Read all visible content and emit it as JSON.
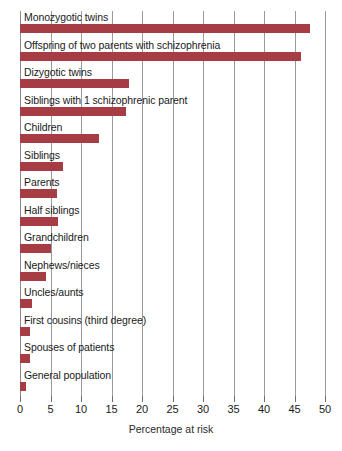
{
  "chart_data": {
    "type": "bar",
    "orientation": "horizontal",
    "title": "",
    "xlabel": "Percentage at risk",
    "ylabel": "",
    "xlim": [
      0,
      50
    ],
    "xticks": [
      0,
      5,
      10,
      15,
      20,
      25,
      30,
      35,
      40,
      45,
      50
    ],
    "grid": true,
    "legend": null,
    "bar_color": "#a63c44",
    "categories": [
      "Monozygotic twins",
      "Offspring of two parents with schizophrenia",
      "Dizygotic twins",
      "Siblings with 1 schizophrenic parent",
      "Children",
      "Siblings",
      "Parents",
      "Half siblings",
      "Grandchildren",
      "Nephews/nieces",
      "Uncles/aunts",
      "First cousins (third degree)",
      "Spouses of patients",
      "General population"
    ],
    "values": [
      47.5,
      46,
      17.8,
      17.3,
      13,
      7,
      6,
      6.3,
      5,
      4.2,
      2,
      1.6,
      1.7,
      1
    ]
  },
  "axis": {
    "x_title": "Percentage at risk",
    "tick_labels": [
      "0",
      "5",
      "10",
      "15",
      "20",
      "25",
      "30",
      "35",
      "40",
      "45",
      "50"
    ]
  }
}
